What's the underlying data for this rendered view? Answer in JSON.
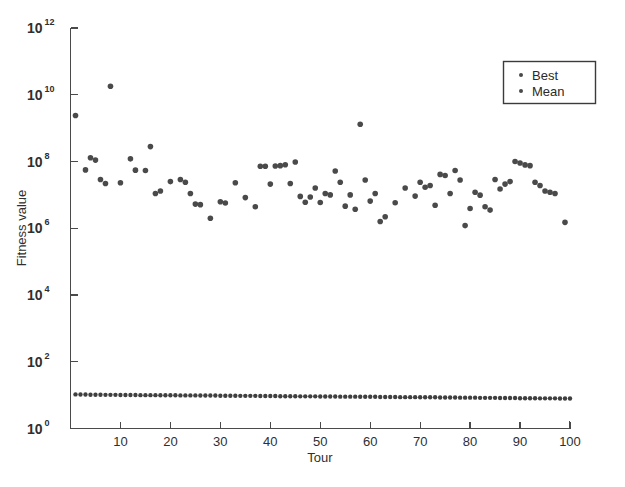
{
  "chart_data": {
    "type": "scatter",
    "title": "",
    "xlabel": "Tour",
    "ylabel": "Fitness value",
    "yscale": "log",
    "ylim": [
      1,
      1000000000000
    ],
    "xlim": [
      0,
      100
    ],
    "grid": false,
    "legend_position": "top-right",
    "y_tick_labels": [
      "10^12",
      "10^10",
      "10^8",
      "10^6",
      "10^4",
      "10^2",
      "10^0"
    ],
    "y_tick_exponents": [
      12,
      10,
      8,
      6,
      4,
      2,
      0
    ],
    "y_tick_base": "10",
    "x_tick_labels": [
      "10",
      "20",
      "30",
      "40",
      "50",
      "60",
      "70",
      "80",
      "90",
      "100"
    ],
    "x_tick_values": [
      10,
      20,
      30,
      40,
      50,
      60,
      70,
      80,
      90,
      100
    ],
    "series": [
      {
        "name": "Best",
        "marker": "dot",
        "color": "#3f3f3f",
        "x": [
          1,
          2,
          3,
          4,
          5,
          6,
          7,
          8,
          9,
          10,
          11,
          12,
          13,
          14,
          15,
          16,
          17,
          18,
          19,
          20,
          21,
          22,
          23,
          24,
          25,
          26,
          27,
          28,
          29,
          30,
          31,
          32,
          33,
          34,
          35,
          36,
          37,
          38,
          39,
          40,
          41,
          42,
          43,
          44,
          45,
          46,
          47,
          48,
          49,
          50,
          51,
          52,
          53,
          54,
          55,
          56,
          57,
          58,
          59,
          60,
          61,
          62,
          63,
          64,
          65,
          66,
          67,
          68,
          69,
          70,
          71,
          72,
          73,
          74,
          75,
          76,
          77,
          78,
          79,
          80,
          81,
          82,
          83,
          84,
          85,
          86,
          87,
          88,
          89,
          90,
          91,
          92,
          93,
          94,
          95,
          96,
          97,
          98,
          99,
          100
        ],
        "y": [
          10.5,
          10.4,
          10.4,
          10.3,
          10.3,
          10.3,
          10.2,
          10.2,
          10.2,
          10.1,
          10.1,
          10.1,
          10.1,
          10.0,
          10.0,
          10.0,
          10.0,
          9.9,
          9.9,
          9.9,
          9.9,
          9.8,
          9.8,
          9.8,
          9.8,
          9.7,
          9.7,
          9.7,
          9.7,
          9.6,
          9.6,
          9.6,
          9.6,
          9.5,
          9.5,
          9.5,
          9.5,
          9.4,
          9.4,
          9.4,
          9.4,
          9.3,
          9.3,
          9.3,
          9.3,
          9.2,
          9.2,
          9.2,
          9.2,
          9.1,
          9.1,
          9.1,
          9.1,
          9.0,
          9.0,
          9.0,
          9.0,
          8.9,
          8.9,
          8.9,
          8.9,
          8.8,
          8.8,
          8.8,
          8.8,
          8.7,
          8.7,
          8.7,
          8.7,
          8.6,
          8.6,
          8.6,
          8.6,
          8.5,
          8.5,
          8.5,
          8.5,
          8.4,
          8.4,
          8.4,
          8.4,
          8.3,
          8.3,
          8.3,
          8.3,
          8.2,
          8.2,
          8.2,
          8.2,
          8.1,
          8.1,
          8.1,
          8.1,
          8.0,
          8.0,
          8.0,
          8.0,
          7.9,
          7.9,
          7.9
        ]
      },
      {
        "name": "Mean",
        "marker": "dot",
        "color": "#4a4a4a",
        "x": [
          1,
          3,
          4,
          5,
          6,
          7,
          8,
          10,
          12,
          13,
          15,
          16,
          17,
          18,
          20,
          22,
          23,
          24,
          25,
          26,
          28,
          30,
          31,
          33,
          35,
          37,
          38,
          39,
          40,
          41,
          42,
          43,
          44,
          45,
          46,
          47,
          48,
          49,
          50,
          51,
          52,
          53,
          54,
          55,
          56,
          57,
          58,
          59,
          60,
          61,
          62,
          63,
          65,
          67,
          69,
          70,
          71,
          72,
          73,
          74,
          75,
          76,
          77,
          78,
          79,
          80,
          81,
          82,
          83,
          84,
          85,
          86,
          87,
          88,
          89,
          90,
          91,
          92,
          93,
          94,
          95,
          96,
          97,
          99
        ],
        "y": [
          2400000000.0,
          56000000.0,
          130000000.0,
          110000000.0,
          29000000.0,
          22000000.0,
          18000000000.0,
          23000000.0,
          120000000.0,
          55000000.0,
          54000000.0,
          280000000.0,
          11000000.0,
          13000000.0,
          25000000.0,
          29000000.0,
          24000000.0,
          11000000.0,
          5300000.0,
          5100000.0,
          2000000.0,
          6200000.0,
          5700000.0,
          23000000.0,
          8300000.0,
          4400000.0,
          72000000.0,
          72000000.0,
          21000000.0,
          73000000.0,
          75000000.0,
          80000000.0,
          22000000.0,
          97000000.0,
          9000000.0,
          6000000.0,
          8600000.0,
          16000000.0,
          5900000.0,
          11000000.0,
          10000000.0,
          52000000.0,
          24000000.0,
          4600000.0,
          10000000.0,
          3700000.0,
          1300000000.0,
          28000000.0,
          6500000.0,
          11000000.0,
          1600000.0,
          2200000.0,
          5800000.0,
          16000000.0,
          9200000.0,
          24000000.0,
          17000000.0,
          19000000.0,
          4900000.0,
          41000000.0,
          38000000.0,
          11000000.0,
          54000000.0,
          28000000.0,
          1200000.0,
          3900000.0,
          12000000.0,
          9800000.0,
          4400000.0,
          3500000.0,
          29000000.0,
          15000000.0,
          21000000.0,
          25000000.0,
          100000000.0,
          90000000.0,
          79000000.0,
          75000000.0,
          24000000.0,
          19000000.0,
          13000000.0,
          12000000.0,
          11000000.0,
          1500000.0
        ]
      }
    ]
  },
  "legend": {
    "entries": [
      {
        "label": "Best"
      },
      {
        "label": "Mean"
      }
    ]
  },
  "axes": {
    "x_title": "Tour",
    "y_title": "Fitness value"
  }
}
